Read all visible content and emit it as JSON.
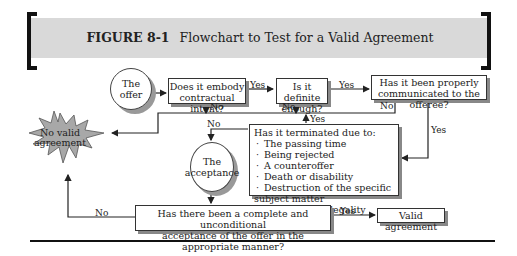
{
  "figure": {
    "number": "FIGURE 8-1",
    "title": "Flowchart to Test for a Valid Agreement"
  },
  "nodes": {
    "offer": "The offer",
    "contractual_intent": [
      "Does it embody",
      "contractual intent?"
    ],
    "definite": [
      "Is it definite",
      "enough?"
    ],
    "communicated": [
      "Has it been properly",
      "communicated to the offeree?"
    ],
    "terminated": {
      "heading": "Has it terminated due to:",
      "items": [
        "The passing time",
        "Being rejected",
        "A counteroffer",
        "Death or disability",
        "Destruction of the specific subject matter",
        "Subsequent illegality"
      ]
    },
    "acceptance": [
      "The",
      "acceptance"
    ],
    "complete_acceptance": [
      "Has there been a complete and unconditional",
      "acceptance of the offer in the appropriate manner?"
    ],
    "valid": "Valid agreement",
    "no_valid": [
      "No valid",
      "agreement"
    ]
  },
  "edge_labels": {
    "yes": "Yes",
    "no": "No"
  }
}
